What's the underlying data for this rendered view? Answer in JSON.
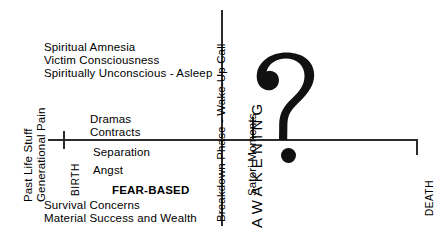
{
  "diagram": {
    "upper_left_block": [
      "Spiritual Amnesia",
      "Victim Consciousness",
      "Spiritually Unconscious - Asleep"
    ],
    "mid_upper": {
      "dramas": "Dramas",
      "contracts": "Contracts"
    },
    "mid_lower": {
      "separation": "Separation",
      "angst": "Angst"
    },
    "fear_based": "FEAR-BASED",
    "lower_left_block": [
      "Survival Concerns",
      "Material Success and Wealth"
    ],
    "vertical_labels": {
      "past_life_stuff": "Past Life Stuff",
      "generational_pain": "Generational Pain",
      "birth": "BIRTH",
      "breakdown_phase": "Breakdown Phase - Wake-Up Call",
      "satori_moments": "Satori Moments",
      "awakening": "AWAKENING",
      "death": "DEATH"
    },
    "symbols": {
      "question_mark": "?",
      "question_mark_dot": "•"
    },
    "colors": {
      "ink": "#2b2b2b",
      "glyph": "#111111",
      "background": "#ffffff"
    }
  }
}
